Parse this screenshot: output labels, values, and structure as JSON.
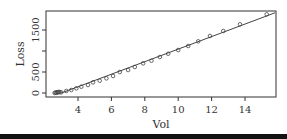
{
  "chart_data": {
    "type": "scatter",
    "title": "",
    "xlabel": "Vol",
    "ylabel": "Loss",
    "xlim": [
      2.4,
      15.8
    ],
    "ylim": [
      -80,
      1950
    ],
    "x_ticks": [
      4,
      6,
      8,
      10,
      12,
      14
    ],
    "x_tick_labels": [
      "4",
      "6",
      "8",
      "10",
      "12",
      "14"
    ],
    "y_ticks": [
      0,
      500,
      1000,
      1500
    ],
    "y_tick_labels": [
      "0",
      "500",
      "",
      "1500"
    ],
    "grid": false,
    "legend": null,
    "series": [
      {
        "name": "observations",
        "marker": "open-circle",
        "x": [
          2.6,
          2.65,
          2.7,
          2.75,
          2.8,
          2.85,
          2.9,
          3.0,
          3.3,
          3.6,
          3.9,
          4.2,
          4.6,
          4.9,
          5.3,
          5.7,
          6.1,
          6.5,
          7.0,
          7.4,
          7.9,
          8.4,
          8.9,
          9.4,
          10.0,
          10.6,
          11.2,
          11.9,
          12.7,
          13.7,
          15.3
        ],
        "y": [
          0,
          10,
          5,
          20,
          15,
          25,
          20,
          16,
          48,
          71,
          111,
          150,
          190,
          254,
          293,
          349,
          405,
          500,
          547,
          619,
          706,
          769,
          857,
          935,
          1023,
          1119,
          1230,
          1357,
          1476,
          1635,
          1873
        ]
      },
      {
        "name": "fitted line",
        "type": "line",
        "x": [
          3.0,
          15.8
        ],
        "y": [
          0,
          1910
        ]
      }
    ]
  },
  "colors": {
    "axis": "#333333",
    "points": "#444444",
    "line": "#444444",
    "bar": "#111111"
  }
}
